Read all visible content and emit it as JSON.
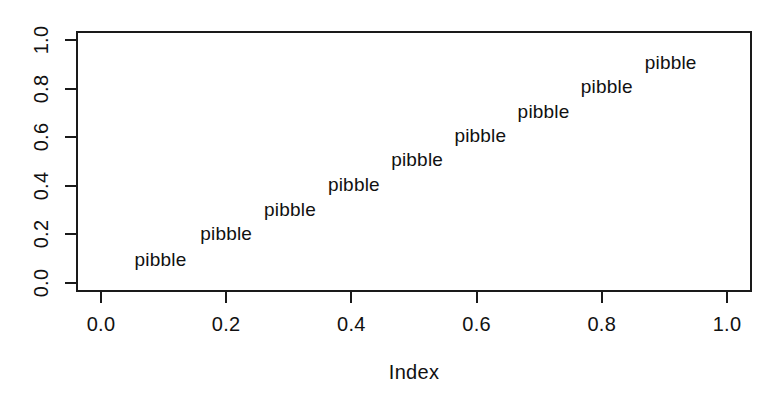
{
  "chart_data": {
    "type": "scatter",
    "title": "",
    "subtitle": "",
    "xlabel": "Index",
    "ylabel": "",
    "xlim": [
      0.0,
      1.0
    ],
    "ylim": [
      0.0,
      1.0
    ],
    "grid": false,
    "legend": null,
    "point_marker": "text",
    "x_ticks": [
      "0.0",
      "0.2",
      "0.4",
      "0.6",
      "0.8",
      "1.0"
    ],
    "x_tick_values": [
      0.0,
      0.2,
      0.4,
      0.6,
      0.8,
      1.0
    ],
    "y_ticks": [
      "0.0",
      "0.2",
      "0.4",
      "0.6",
      "0.8",
      "1.0"
    ],
    "y_tick_values": [
      0.0,
      0.2,
      0.4,
      0.6,
      0.8,
      1.0
    ],
    "series": [
      {
        "name": "pibble",
        "label_text": "pibble",
        "points": [
          {
            "x": 0.095,
            "y": 0.095,
            "label": "pibble"
          },
          {
            "x": 0.2,
            "y": 0.2,
            "label": "pibble"
          },
          {
            "x": 0.302,
            "y": 0.3,
            "label": "pibble"
          },
          {
            "x": 0.404,
            "y": 0.405,
            "label": "pibble"
          },
          {
            "x": 0.505,
            "y": 0.505,
            "label": "pibble"
          },
          {
            "x": 0.606,
            "y": 0.605,
            "label": "pibble"
          },
          {
            "x": 0.707,
            "y": 0.705,
            "label": "pibble"
          },
          {
            "x": 0.808,
            "y": 0.805,
            "label": "pibble"
          },
          {
            "x": 0.91,
            "y": 0.905,
            "label": "pibble"
          }
        ]
      }
    ],
    "colors": {
      "text": "#111111",
      "axis": "#1a1a1a",
      "background": "#ffffff"
    }
  }
}
